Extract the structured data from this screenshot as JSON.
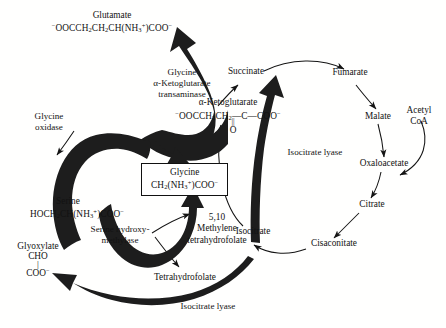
{
  "figure": {
    "background_color": "#ffffff",
    "ink_color": "#111111",
    "thick_arrow_color": "#1c1c1c"
  },
  "metabolites": {
    "glutamate": {
      "name": "Glutamate",
      "formula_html": "<sup>&minus;</sup>OOCCH<sub>2</sub>CH<sub>2</sub>CH(NH<sub>3</sub><sup>+</sup>)COO<sup>&minus;</sup>"
    },
    "alpha_ketoglutarate": {
      "name": "α-Ketoglutarate",
      "formula_html": "<sup>&minus;</sup>OOCCH<sub>2</sub>CH<sub>2</sub>—C—COO<sup>&minus;</sup>",
      "carbonyl_bond": "||",
      "carbonyl_atom": "O"
    },
    "glycine": {
      "name": "Glycine",
      "formula_html": "CH<sub>2</sub>(NH<sub>3</sub><sup>+</sup>)COO<sup>&minus;</sup>",
      "boxed": true
    },
    "serine": {
      "name": "Serine",
      "formula_html": "HOCH<sub>2</sub>CH(NH<sub>3</sub><sup>+</sup>)COO<sup>&minus;</sup>"
    },
    "glyoxylate": {
      "name": "Glyoxylate",
      "line1": "CHO",
      "bond": "|",
      "line2_html": "COO<sup>&minus;</sup>"
    },
    "succinate": {
      "name": "Succinate"
    },
    "fumarate": {
      "name": "Fumarate"
    },
    "malate": {
      "name": "Malate"
    },
    "oxaloacetate": {
      "name": "Oxaloacetate"
    },
    "acetyl_coa": {
      "name": "Acetyl",
      "name_line2": "CoA"
    },
    "citrate": {
      "name": "Citrate"
    },
    "cisaconitate": {
      "name": "Cisaconitate"
    },
    "isocitrate": {
      "name": "Isocitrate"
    },
    "tetrahydrofolate": {
      "name": "Tetrahydrofolate"
    },
    "methylene_thf": {
      "line1": "5,10",
      "line2": "Methylene",
      "line3": "tetrahydrofolate"
    }
  },
  "enzymes": {
    "glycine_oxidase": {
      "line1": "Glycine",
      "line2": "oxidase"
    },
    "glycine_akg_transaminase": {
      "line1": "Glycine",
      "line2": "α-Ketoglutarate",
      "line3": "transaminase"
    },
    "serine_hydroxymethylase": {
      "line1": "Serine hydroxy-",
      "line2": "methylase"
    },
    "isocitrate_lyase_right": {
      "label": "Isocitrate lyase"
    },
    "isocitrate_lyase_bottom": {
      "label": "Isocitrate lyase"
    }
  }
}
